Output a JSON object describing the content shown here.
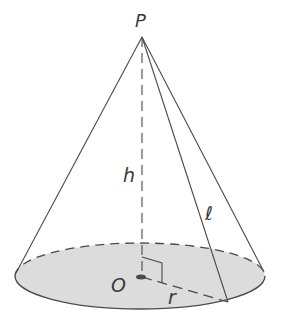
{
  "diagram": {
    "labels": {
      "apex": "P",
      "height": "h",
      "slant": "ℓ",
      "center": "O",
      "radius": "r"
    },
    "colors": {
      "line": "#4a4a4a",
      "base_fill": "#dcdcdc",
      "background": "#ffffff"
    }
  }
}
